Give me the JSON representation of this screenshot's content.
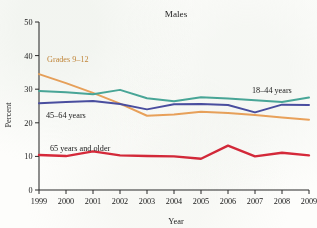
{
  "chart_data": {
    "type": "line",
    "title": "Males",
    "xlabel": "Year",
    "ylabel": "Percent",
    "categories": [
      "1999",
      "2000",
      "2001",
      "2002",
      "2003",
      "2004",
      "2005",
      "2006",
      "2007",
      "2008",
      "2009"
    ],
    "x": [
      1999,
      2000,
      2001,
      2002,
      2003,
      2004,
      2005,
      2006,
      2007,
      2008,
      2009
    ],
    "xlim": [
      1999,
      2009
    ],
    "ylim": [
      0,
      50
    ],
    "yticks": [
      0,
      10,
      20,
      30,
      40,
      50
    ],
    "ytick_labels": [
      "0",
      "10",
      "20",
      "30",
      "40",
      "50"
    ],
    "grid": false,
    "legend_position": "inline-labels",
    "series": [
      {
        "name": "Grades 9–12",
        "color": "#eea45c",
        "label_color": "#c98a3c",
        "values": [
          34.5,
          31.8,
          28.9,
          25.7,
          22.1,
          22.5,
          23.3,
          22.9,
          22.3,
          21.6,
          20.9
        ]
      },
      {
        "name": "18–44 years",
        "color": "#4aa99b",
        "label_color": "#1b1b1b",
        "values": [
          29.5,
          29.1,
          28.5,
          29.8,
          27.3,
          26.4,
          27.6,
          27.2,
          26.7,
          26.2,
          27.5
        ]
      },
      {
        "name": "45–64 years",
        "color": "#4b4fa3",
        "label_color": "#1b1b1b",
        "values": [
          25.8,
          26.2,
          26.5,
          25.6,
          24.0,
          25.5,
          25.6,
          25.3,
          23.1,
          25.4,
          25.3
        ]
      },
      {
        "name": "65 years and older",
        "color": "#d8293a",
        "label_color": "#1b1b1b",
        "values": [
          10.4,
          10.1,
          11.5,
          10.3,
          10.1,
          10.0,
          9.3,
          13.2,
          10.0,
          11.1,
          10.3
        ]
      }
    ],
    "annotations": [
      {
        "text": "Grades 9–12",
        "series": "Grades 9–12",
        "color": "#c98a3c"
      },
      {
        "text": "18–44 years",
        "series": "18–44 years",
        "color": "#1b1b1b"
      },
      {
        "text": "45–64 years",
        "series": "45–64 years",
        "color": "#1b1b1b"
      },
      {
        "text": "65 years and older",
        "series": "65 years and older",
        "color": "#1b1b1b"
      }
    ]
  }
}
